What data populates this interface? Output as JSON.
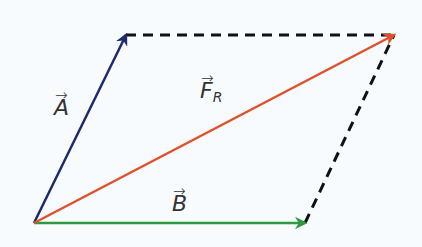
{
  "diagram": {
    "type": "vector-parallelogram",
    "background": "#f8fbfd",
    "origin": [
      34,
      223
    ],
    "vectors": [
      {
        "id": "A",
        "label": "A",
        "subscript": "",
        "from": [
          34,
          223
        ],
        "to": [
          126,
          35
        ],
        "color": "#1f2a6b",
        "label_pos": [
          54,
          97
        ]
      },
      {
        "id": "B",
        "label": "B",
        "subscript": "",
        "from": [
          34,
          223
        ],
        "to": [
          305,
          223
        ],
        "color": "#2e9a3e",
        "label_pos": [
          172,
          193
        ]
      },
      {
        "id": "FR",
        "label": "F",
        "subscript": "R",
        "from": [
          34,
          223
        ],
        "to": [
          394,
          35
        ],
        "color": "#e0502a",
        "label_pos": [
          200,
          80
        ]
      }
    ],
    "dashed_lines": [
      {
        "from": [
          126,
          35
        ],
        "to": [
          394,
          35
        ],
        "color": "#111111"
      },
      {
        "from": [
          305,
          223
        ],
        "to": [
          394,
          35
        ],
        "color": "#111111"
      }
    ],
    "arrow_glyph": "→"
  }
}
